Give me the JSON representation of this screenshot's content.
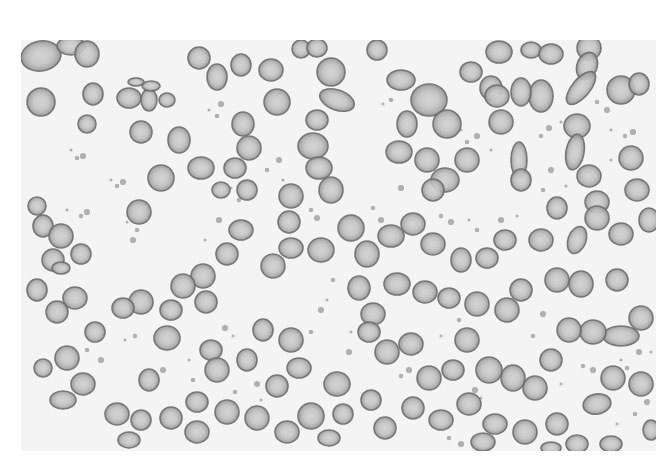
{
  "image": {
    "subject": "peripheral blood smear micrograph, grayscale",
    "frame": {
      "x": 21,
      "y": 40,
      "width": 635,
      "height": 411
    },
    "colors": {
      "page_background": "#ffffff",
      "slide_background": "#f4f4f4",
      "cell_fill": "#bdbdbd",
      "cell_center": "#d2d2d2",
      "cell_rim": "#6e6e6e",
      "debris": "#9a9a9a"
    },
    "cells": [
      [
        20,
        16,
        20,
        15,
        -10
      ],
      [
        50,
        6,
        14,
        9,
        0
      ],
      [
        66,
        14,
        12,
        13,
        0
      ],
      [
        20,
        62,
        14,
        14,
        0
      ],
      [
        72,
        54,
        10,
        11,
        0
      ],
      [
        108,
        58,
        12,
        10,
        0
      ],
      [
        66,
        84,
        9,
        9,
        0
      ],
      [
        128,
        60,
        8,
        11,
        0
      ],
      [
        130,
        46,
        9,
        5,
        0
      ],
      [
        115,
        42,
        8,
        4,
        0
      ],
      [
        178,
        18,
        11,
        11,
        0
      ],
      [
        196,
        37,
        10,
        13,
        0
      ],
      [
        220,
        25,
        10,
        11,
        0
      ],
      [
        250,
        30,
        12,
        11,
        0
      ],
      [
        280,
        9,
        9,
        9,
        0
      ],
      [
        296,
        8,
        10,
        9,
        0
      ],
      [
        310,
        32,
        14,
        14,
        0
      ],
      [
        316,
        60,
        18,
        10,
        20
      ],
      [
        296,
        80,
        11,
        10,
        0
      ],
      [
        292,
        106,
        15,
        13,
        0
      ],
      [
        256,
        62,
        13,
        13,
        0
      ],
      [
        222,
        84,
        11,
        12,
        0
      ],
      [
        228,
        108,
        12,
        12,
        0
      ],
      [
        214,
        128,
        11,
        10,
        0
      ],
      [
        180,
        128,
        13,
        11,
        0
      ],
      [
        200,
        150,
        9,
        8,
        0
      ],
      [
        226,
        150,
        10,
        10,
        0
      ],
      [
        158,
        100,
        11,
        13,
        0
      ],
      [
        146,
        60,
        8,
        7,
        0
      ],
      [
        120,
        92,
        11,
        11,
        0
      ],
      [
        140,
        138,
        13,
        13,
        0
      ],
      [
        118,
        172,
        12,
        12,
        0
      ],
      [
        270,
        156,
        12,
        12,
        0
      ],
      [
        298,
        128,
        13,
        11,
        0
      ],
      [
        310,
        150,
        12,
        13,
        0
      ],
      [
        268,
        182,
        11,
        11,
        0
      ],
      [
        330,
        188,
        13,
        13,
        0
      ],
      [
        300,
        210,
        13,
        12,
        0
      ],
      [
        270,
        208,
        12,
        10,
        0
      ],
      [
        252,
        226,
        12,
        12,
        0
      ],
      [
        220,
        190,
        12,
        10,
        0
      ],
      [
        206,
        214,
        11,
        11,
        0
      ],
      [
        182,
        236,
        12,
        12,
        0
      ],
      [
        185,
        262,
        11,
        11,
        0
      ],
      [
        162,
        246,
        12,
        12,
        0
      ],
      [
        150,
        270,
        11,
        10,
        0
      ],
      [
        120,
        262,
        12,
        12,
        0
      ],
      [
        102,
        268,
        11,
        10,
        0
      ],
      [
        54,
        258,
        12,
        11,
        0
      ],
      [
        36,
        272,
        11,
        11,
        0
      ],
      [
        16,
        250,
        10,
        11,
        0
      ],
      [
        32,
        220,
        11,
        11,
        0
      ],
      [
        22,
        186,
        10,
        11,
        0
      ],
      [
        16,
        166,
        9,
        9,
        0
      ],
      [
        40,
        196,
        12,
        12,
        0
      ],
      [
        60,
        214,
        10,
        10,
        0
      ],
      [
        40,
        228,
        9,
        6,
        0
      ],
      [
        74,
        292,
        10,
        10,
        0
      ],
      [
        46,
        318,
        12,
        12,
        0
      ],
      [
        22,
        328,
        9,
        9,
        0
      ],
      [
        128,
        340,
        10,
        11,
        0
      ],
      [
        146,
        298,
        13,
        12,
        0
      ],
      [
        190,
        310,
        11,
        10,
        0
      ],
      [
        196,
        330,
        12,
        12,
        0
      ],
      [
        226,
        320,
        10,
        11,
        0
      ],
      [
        242,
        290,
        10,
        11,
        0
      ],
      [
        270,
        300,
        12,
        12,
        0
      ],
      [
        278,
        328,
        12,
        10,
        0
      ],
      [
        256,
        346,
        11,
        11,
        0
      ],
      [
        316,
        344,
        13,
        12,
        0
      ],
      [
        322,
        374,
        10,
        10,
        0
      ],
      [
        290,
        376,
        13,
        13,
        0
      ],
      [
        308,
        398,
        11,
        8,
        0
      ],
      [
        266,
        392,
        12,
        11,
        0
      ],
      [
        236,
        378,
        12,
        12,
        0
      ],
      [
        206,
        372,
        12,
        12,
        0
      ],
      [
        176,
        362,
        11,
        10,
        0
      ],
      [
        176,
        392,
        12,
        11,
        0
      ],
      [
        150,
        378,
        11,
        11,
        0
      ],
      [
        120,
        380,
        10,
        10,
        0
      ],
      [
        108,
        400,
        11,
        8,
        0
      ],
      [
        96,
        374,
        12,
        11,
        0
      ],
      [
        62,
        344,
        12,
        11,
        0
      ],
      [
        42,
        360,
        13,
        9,
        0
      ],
      [
        356,
        10,
        10,
        10,
        0
      ],
      [
        380,
        40,
        14,
        10,
        0
      ],
      [
        386,
        84,
        10,
        13,
        0
      ],
      [
        408,
        60,
        18,
        16,
        0
      ],
      [
        426,
        84,
        14,
        14,
        0
      ],
      [
        406,
        120,
        12,
        12,
        0
      ],
      [
        378,
        112,
        13,
        11,
        0
      ],
      [
        424,
        140,
        14,
        12,
        0
      ],
      [
        412,
        150,
        11,
        11,
        0
      ],
      [
        446,
        120,
        12,
        12,
        0
      ],
      [
        470,
        48,
        11,
        12,
        0
      ],
      [
        450,
        32,
        11,
        10,
        0
      ],
      [
        478,
        12,
        13,
        11,
        0
      ],
      [
        510,
        10,
        10,
        8,
        0
      ],
      [
        530,
        14,
        12,
        10,
        0
      ],
      [
        568,
        8,
        12,
        12,
        0
      ],
      [
        566,
        26,
        10,
        14,
        20
      ],
      [
        560,
        48,
        9,
        20,
        40
      ],
      [
        600,
        50,
        14,
        14,
        0
      ],
      [
        618,
        44,
        10,
        11,
        0
      ],
      [
        556,
        86,
        13,
        12,
        0
      ],
      [
        520,
        56,
        12,
        16,
        0
      ],
      [
        500,
        52,
        10,
        14,
        0
      ],
      [
        476,
        56,
        12,
        11,
        0
      ],
      [
        480,
        82,
        12,
        12,
        0
      ],
      [
        498,
        120,
        8,
        18,
        0
      ],
      [
        500,
        140,
        10,
        11,
        0
      ],
      [
        554,
        112,
        9,
        18,
        10
      ],
      [
        568,
        136,
        12,
        11,
        0
      ],
      [
        576,
        162,
        12,
        11,
        0
      ],
      [
        610,
        118,
        12,
        12,
        0
      ],
      [
        616,
        150,
        12,
        11,
        0
      ],
      [
        600,
        194,
        12,
        11,
        0
      ],
      [
        628,
        180,
        10,
        12,
        0
      ],
      [
        576,
        178,
        12,
        12,
        0
      ],
      [
        556,
        200,
        9,
        14,
        20
      ],
      [
        536,
        168,
        10,
        11,
        0
      ],
      [
        520,
        200,
        12,
        11,
        0
      ],
      [
        484,
        200,
        11,
        10,
        0
      ],
      [
        466,
        218,
        11,
        10,
        0
      ],
      [
        440,
        220,
        10,
        12,
        0
      ],
      [
        412,
        204,
        12,
        11,
        0
      ],
      [
        392,
        184,
        12,
        11,
        0
      ],
      [
        370,
        196,
        13,
        11,
        0
      ],
      [
        346,
        214,
        12,
        13,
        0
      ],
      [
        338,
        248,
        11,
        12,
        0
      ],
      [
        352,
        274,
        12,
        11,
        0
      ],
      [
        376,
        244,
        13,
        11,
        0
      ],
      [
        404,
        252,
        12,
        11,
        0
      ],
      [
        428,
        258,
        11,
        10,
        0
      ],
      [
        456,
        264,
        12,
        12,
        0
      ],
      [
        486,
        270,
        12,
        12,
        0
      ],
      [
        500,
        250,
        11,
        11,
        0
      ],
      [
        536,
        240,
        12,
        12,
        0
      ],
      [
        560,
        244,
        12,
        13,
        0
      ],
      [
        596,
        240,
        11,
        11,
        0
      ],
      [
        620,
        278,
        12,
        12,
        0
      ],
      [
        600,
        296,
        18,
        10,
        0
      ],
      [
        572,
        292,
        13,
        12,
        0
      ],
      [
        548,
        290,
        12,
        12,
        0
      ],
      [
        530,
        320,
        11,
        11,
        0
      ],
      [
        514,
        348,
        12,
        12,
        0
      ],
      [
        492,
        338,
        12,
        13,
        0
      ],
      [
        468,
        330,
        13,
        13,
        0
      ],
      [
        446,
        300,
        12,
        12,
        0
      ],
      [
        432,
        330,
        11,
        10,
        0
      ],
      [
        408,
        338,
        12,
        12,
        0
      ],
      [
        390,
        304,
        12,
        11,
        0
      ],
      [
        366,
        312,
        12,
        12,
        0
      ],
      [
        348,
        292,
        11,
        10,
        0
      ],
      [
        474,
        384,
        12,
        10,
        0
      ],
      [
        448,
        364,
        12,
        11,
        0
      ],
      [
        420,
        380,
        12,
        10,
        0
      ],
      [
        392,
        368,
        11,
        11,
        0
      ],
      [
        364,
        388,
        11,
        11,
        0
      ],
      [
        350,
        360,
        10,
        10,
        0
      ],
      [
        462,
        402,
        12,
        9,
        0
      ],
      [
        504,
        392,
        12,
        12,
        0
      ],
      [
        536,
        384,
        11,
        11,
        0
      ],
      [
        576,
        364,
        14,
        10,
        -10
      ],
      [
        592,
        338,
        12,
        12,
        0
      ],
      [
        620,
        344,
        12,
        12,
        0
      ],
      [
        630,
        390,
        8,
        10,
        0
      ],
      [
        556,
        404,
        11,
        9,
        0
      ],
      [
        590,
        404,
        11,
        8,
        0
      ],
      [
        530,
        408,
        10,
        6,
        0
      ]
    ],
    "debris": [
      [
        50,
        110
      ],
      [
        56,
        118
      ],
      [
        62,
        116
      ],
      [
        90,
        140
      ],
      [
        96,
        146
      ],
      [
        102,
        142
      ],
      [
        46,
        170
      ],
      [
        60,
        176
      ],
      [
        66,
        172
      ],
      [
        106,
        182
      ],
      [
        116,
        190
      ],
      [
        112,
        200
      ],
      [
        188,
        70
      ],
      [
        196,
        76
      ],
      [
        200,
        64
      ],
      [
        210,
        148
      ],
      [
        218,
        160
      ],
      [
        198,
        180
      ],
      [
        184,
        200
      ],
      [
        246,
        130
      ],
      [
        258,
        120
      ],
      [
        262,
        140
      ],
      [
        290,
        170
      ],
      [
        296,
        178
      ],
      [
        362,
        64
      ],
      [
        370,
        60
      ],
      [
        380,
        148
      ],
      [
        398,
        176
      ],
      [
        352,
        168
      ],
      [
        360,
        180
      ],
      [
        440,
        90
      ],
      [
        446,
        102
      ],
      [
        456,
        96
      ],
      [
        470,
        110
      ],
      [
        520,
        96
      ],
      [
        528,
        88
      ],
      [
        540,
        82
      ],
      [
        576,
        62
      ],
      [
        586,
        70
      ],
      [
        590,
        90
      ],
      [
        604,
        96
      ],
      [
        612,
        92
      ],
      [
        590,
        120
      ],
      [
        522,
        150
      ],
      [
        530,
        130
      ],
      [
        545,
        146
      ],
      [
        420,
        176
      ],
      [
        430,
        182
      ],
      [
        448,
        180
      ],
      [
        456,
        190
      ],
      [
        480,
        180
      ],
      [
        496,
        176
      ],
      [
        66,
        310
      ],
      [
        80,
        320
      ],
      [
        104,
        300
      ],
      [
        114,
        296
      ],
      [
        142,
        330
      ],
      [
        168,
        320
      ],
      [
        172,
        340
      ],
      [
        204,
        288
      ],
      [
        212,
        296
      ],
      [
        214,
        352
      ],
      [
        236,
        344
      ],
      [
        240,
        360
      ],
      [
        290,
        292
      ],
      [
        300,
        270
      ],
      [
        306,
        260
      ],
      [
        312,
        240
      ],
      [
        328,
        312
      ],
      [
        330,
        292
      ],
      [
        380,
        336
      ],
      [
        388,
        330
      ],
      [
        420,
        296
      ],
      [
        438,
        280
      ],
      [
        454,
        350
      ],
      [
        460,
        358
      ],
      [
        512,
        296
      ],
      [
        522,
        274
      ],
      [
        540,
        344
      ],
      [
        562,
        326
      ],
      [
        572,
        330
      ],
      [
        600,
        320
      ],
      [
        606,
        328
      ],
      [
        618,
        312
      ],
      [
        630,
        312
      ],
      [
        614,
        374
      ],
      [
        626,
        362
      ],
      [
        596,
        384
      ],
      [
        428,
        398
      ],
      [
        440,
        404
      ]
    ]
  }
}
